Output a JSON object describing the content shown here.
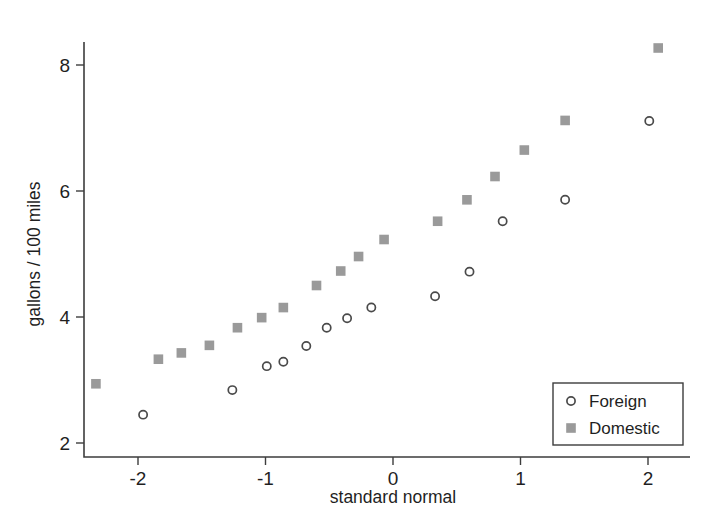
{
  "chart_data": {
    "type": "scatter",
    "title": "",
    "subtitle": "",
    "xlabel": "standard normal",
    "ylabel": "gallons / 100 miles",
    "xlim": [
      -2.55,
      2.3
    ],
    "ylim": [
      1.85,
      8.55
    ],
    "xticks": [
      -2,
      -1,
      0,
      1,
      2
    ],
    "xticklabels": [
      "-2",
      "-1",
      "0",
      "1",
      "2"
    ],
    "yticks": [
      2,
      4,
      6,
      8
    ],
    "yticklabels": [
      "2",
      "4",
      "6",
      "8"
    ],
    "grid": false,
    "legend_position": "lower right",
    "series": [
      {
        "name": "Foreign",
        "marker": "open-circle",
        "color": "#4a4a4a",
        "points": [
          {
            "x": -1.96,
            "y": 2.45
          },
          {
            "x": -1.26,
            "y": 2.84
          },
          {
            "x": -0.99,
            "y": 3.22
          },
          {
            "x": -0.86,
            "y": 3.29
          },
          {
            "x": -0.68,
            "y": 3.54
          },
          {
            "x": -0.52,
            "y": 3.83
          },
          {
            "x": -0.36,
            "y": 3.98
          },
          {
            "x": -0.17,
            "y": 4.15
          },
          {
            "x": 0.33,
            "y": 4.33
          },
          {
            "x": 0.6,
            "y": 4.72
          },
          {
            "x": 0.86,
            "y": 5.52
          },
          {
            "x": 1.35,
            "y": 5.86
          },
          {
            "x": 2.01,
            "y": 7.11
          }
        ]
      },
      {
        "name": "Domestic",
        "marker": "filled-square",
        "color": "#9a9a9a",
        "points": [
          {
            "x": -2.33,
            "y": 2.94
          },
          {
            "x": -1.84,
            "y": 3.33
          },
          {
            "x": -1.66,
            "y": 3.43
          },
          {
            "x": -1.44,
            "y": 3.55
          },
          {
            "x": -1.22,
            "y": 3.83
          },
          {
            "x": -1.03,
            "y": 3.99
          },
          {
            "x": -0.86,
            "y": 4.15
          },
          {
            "x": -0.6,
            "y": 4.5
          },
          {
            "x": -0.41,
            "y": 4.73
          },
          {
            "x": -0.27,
            "y": 4.96
          },
          {
            "x": -0.07,
            "y": 5.23
          },
          {
            "x": 0.35,
            "y": 5.52
          },
          {
            "x": 0.58,
            "y": 5.86
          },
          {
            "x": 0.8,
            "y": 6.23
          },
          {
            "x": 1.03,
            "y": 6.65
          },
          {
            "x": 1.35,
            "y": 7.12
          },
          {
            "x": 2.08,
            "y": 8.27
          }
        ]
      }
    ]
  },
  "legend": {
    "items": [
      {
        "label": "Foreign",
        "marker": "open-circle"
      },
      {
        "label": "Domestic",
        "marker": "filled-square"
      }
    ]
  },
  "colors": {
    "axis": "#3d3d3d",
    "text": "#1f1f1f",
    "foreign_marker": "#4a4a4a",
    "domestic_marker": "#9a9a9a",
    "background": "#ffffff"
  }
}
